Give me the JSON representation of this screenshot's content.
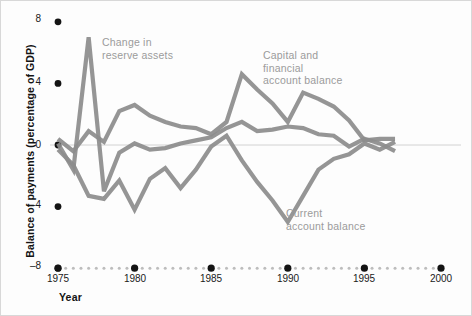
{
  "chart_data": {
    "type": "line",
    "title": "",
    "xlabel": "Year",
    "ylabel": "Balance of payments (percentage of GDP)",
    "xlim": [
      1975,
      2000
    ],
    "ylim": [
      -8,
      8
    ],
    "xticks": [
      1975,
      1980,
      1985,
      1990,
      1995,
      2000
    ],
    "yticks": [
      8,
      4,
      0,
      -4,
      -8
    ],
    "grid": false,
    "zero_line": true,
    "legend_position": "inline-annotations",
    "line_color": "#8c8c8c",
    "label_color": "#9b9b9b",
    "x": [
      1975,
      1976,
      1977,
      1978,
      1979,
      1980,
      1981,
      1982,
      1983,
      1984,
      1985,
      1986,
      1987,
      1988,
      1989,
      1990,
      1991,
      1992,
      1993,
      1994,
      1995,
      1996,
      1997
    ],
    "series": [
      {
        "name": "Change in reserve assets",
        "values": [
          0.1,
          -1.6,
          7.0,
          -3.0,
          -0.5,
          0.1,
          -0.3,
          -0.2,
          0.1,
          0.3,
          0.5,
          1.1,
          1.5,
          0.9,
          1.0,
          1.2,
          1.1,
          0.7,
          0.6,
          -0.1,
          0.4,
          0.1,
          -0.4
        ]
      },
      {
        "name": "Capital and financial account balance",
        "values": [
          0.4,
          -0.4,
          0.9,
          0.2,
          2.2,
          2.6,
          1.9,
          1.5,
          1.2,
          1.1,
          0.7,
          1.5,
          4.6,
          3.6,
          2.7,
          1.5,
          3.4,
          3.0,
          2.5,
          1.6,
          0.3,
          0.4,
          0.4
        ]
      },
      {
        "name": "Current account balance",
        "values": [
          -0.3,
          -1.3,
          -3.3,
          -3.5,
          -2.3,
          -4.2,
          -2.2,
          -1.5,
          -2.8,
          -1.6,
          -0.1,
          0.6,
          -1.0,
          -2.4,
          -3.6,
          -5.0,
          -3.3,
          -1.6,
          -0.9,
          -0.6,
          0.1,
          -0.3,
          0.2
        ]
      }
    ]
  },
  "axes": {
    "y_title": "Balance of payments (percentage of GDP)",
    "x_title": "Year",
    "y_tick_labels": [
      "8",
      "4",
      "0",
      "–4",
      "–8"
    ],
    "x_tick_labels": [
      "1975",
      "1980",
      "1985",
      "1990",
      "1995",
      "2000"
    ]
  },
  "annotations": [
    {
      "id": "reserve-assets",
      "text_line1": "Change in",
      "text_line2": "reserve assets",
      "text_line3": ""
    },
    {
      "id": "capital-financial",
      "text_line1": "Capital and",
      "text_line2": "financial",
      "text_line3": "account balance"
    },
    {
      "id": "current-account",
      "text_line1": "Current",
      "text_line2": "account balance",
      "text_line3": ""
    }
  ]
}
